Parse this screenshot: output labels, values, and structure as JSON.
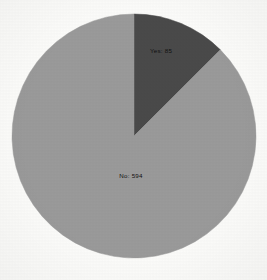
{
  "chart_data": {
    "type": "pie",
    "title": "",
    "subtitle": "",
    "xlabel": "",
    "ylabel": "",
    "grid": false,
    "legend_position": "none",
    "label_format": "category: value",
    "start_angle_deg": 0,
    "direction": "clockwise",
    "total": 679,
    "categories": [
      "Yes",
      "No"
    ],
    "values": [
      85,
      594
    ],
    "percentages": [
      12.5,
      87.5
    ],
    "slices": [
      {
        "category": "Yes",
        "value": 85,
        "percent": 12.5,
        "label": "Yes: 85",
        "color": "#4a4a4a",
        "start_angle_deg": 0,
        "end_angle_deg": 45.1,
        "label_x": 161,
        "label_y": 51
      },
      {
        "category": "No",
        "value": 594,
        "percent": 87.5,
        "label": "No: 594",
        "color": "#9a9a9a",
        "start_angle_deg": 45.1,
        "end_angle_deg": 360,
        "label_x": 131,
        "label_y": 176
      }
    ],
    "annotations": []
  },
  "figure": {
    "background_color": "#fcfcfa",
    "center_x": 134,
    "center_y": 136,
    "radius": 122
  }
}
